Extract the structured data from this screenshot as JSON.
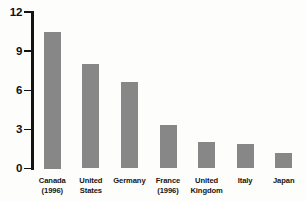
{
  "chart_data": {
    "type": "bar",
    "title": "",
    "categories": [
      "Canada (1996)",
      "United States",
      "Germany",
      "France (1996)",
      "United Kingdom",
      "Italy",
      "Japan"
    ],
    "category_label_lines": [
      [
        "Canada",
        "(1996)"
      ],
      [
        "United",
        "States"
      ],
      [
        "Germany"
      ],
      [
        "France",
        "(1996)"
      ],
      [
        "United",
        "Kingdom"
      ],
      [
        "Italy"
      ],
      [
        "Japan"
      ]
    ],
    "values": [
      10.5,
      8.0,
      6.6,
      3.3,
      2.0,
      1.9,
      1.2
    ],
    "y_ticks": [
      "0",
      "3",
      "6",
      "9",
      "12"
    ],
    "y_tick_values": [
      0,
      3,
      6,
      9,
      12
    ],
    "ylim": [
      0,
      12
    ],
    "xlabel": "",
    "ylabel": "",
    "grid": false,
    "legend": null,
    "colors": {
      "bar": "#878787",
      "axis": "#141414",
      "text": "#0f0f0f",
      "background": "#fdfdfc"
    }
  }
}
